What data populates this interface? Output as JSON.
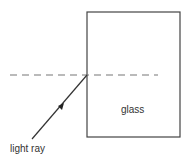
{
  "diagram": {
    "glass_block": {
      "label": "glass",
      "x": 87,
      "y": 12,
      "width": 93,
      "height": 125,
      "stroke": "#444444"
    },
    "normal_line": {
      "style": "dashed",
      "x1": 10,
      "y1": 75,
      "x2": 158,
      "y2": 75,
      "stroke": "#777777"
    },
    "light_ray": {
      "label": "light ray",
      "x1": 32,
      "y1": 139,
      "x2": 87,
      "y2": 75,
      "stroke": "#333333",
      "arrow_direction": "toward glass"
    }
  }
}
